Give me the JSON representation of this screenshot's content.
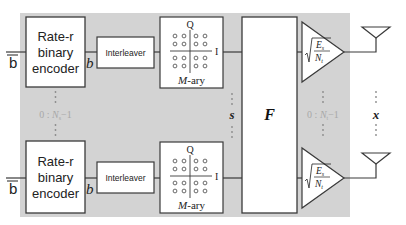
{
  "colors": {
    "background": "#ffffff",
    "shaded_region": "#d3d3d3",
    "block_fill": "#ffffff",
    "stroke": "#3a3a3a",
    "faint_label": "#a8a8a8",
    "dots": "#8a8a8a"
  },
  "input_label": "b",
  "coded_label": "b",
  "encoder": {
    "line1": "Rate-r",
    "line2": "binary",
    "line3": "encoder"
  },
  "interleaver": {
    "label": "Interleaver"
  },
  "modulator": {
    "q_axis": "Q",
    "i_axis": "I",
    "label_italic": "M",
    "label_rest": "-ary"
  },
  "stream_index": {
    "prefix": "0 : ",
    "var": "N",
    "sub": "s",
    "suffix": "−1"
  },
  "symbol_vector": "s",
  "precoder": {
    "label": "F"
  },
  "amplifier": {
    "num_var": "E",
    "num_sub": "s",
    "den_var": "N",
    "den_sub": "t"
  },
  "antenna_index": {
    "prefix": "0 : ",
    "var": "N",
    "sub": "t",
    "suffix": "−1"
  },
  "transmit_vector": "x",
  "rows": [
    "top",
    "bottom"
  ]
}
